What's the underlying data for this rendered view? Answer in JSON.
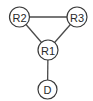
{
  "diagram": {
    "type": "network-topology",
    "nodes": [
      {
        "id": "R2",
        "label": "R2",
        "x": 19.5,
        "y": 17
      },
      {
        "id": "R3",
        "label": "R3",
        "x": 77,
        "y": 17
      },
      {
        "id": "R1",
        "label": "R1",
        "x": 48,
        "y": 50
      },
      {
        "id": "D",
        "label": "D",
        "x": 47.5,
        "y": 89.5
      }
    ],
    "edges": [
      {
        "from": "R2",
        "to": "R3"
      },
      {
        "from": "R2",
        "to": "R1"
      },
      {
        "from": "R3",
        "to": "R1"
      },
      {
        "from": "R1",
        "to": "D"
      }
    ]
  }
}
